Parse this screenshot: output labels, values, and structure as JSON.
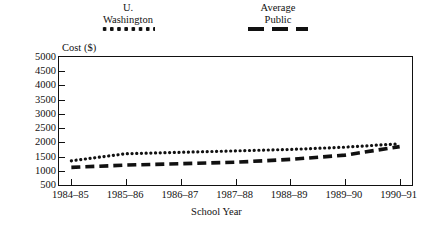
{
  "chart_data": {
    "type": "line",
    "title": "",
    "xlabel": "School Year",
    "ylabel": "Cost ($)",
    "categories": [
      "1984–85",
      "1985–86",
      "1986–87",
      "1987–88",
      "1988–89",
      "1989–90",
      "1990–91"
    ],
    "ylim": [
      500,
      5000
    ],
    "yticks": [
      500,
      1000,
      1500,
      2000,
      2500,
      3000,
      3500,
      4000,
      4500,
      5000
    ],
    "ytick_labels": [
      "500",
      "1000",
      "1500",
      "2000",
      "2500",
      "3000",
      "3500",
      "4000",
      "4500",
      "5000"
    ],
    "grid": false,
    "legend_position": "top",
    "series": [
      {
        "name": "U. Washington",
        "name_lines": "U.\nWashington",
        "style": "dotted",
        "color": "#111111",
        "values": [
          1350,
          1600,
          1650,
          1700,
          1750,
          1830,
          1950
        ]
      },
      {
        "name": "Average Public",
        "name_lines": "Average\nPublic",
        "style": "dashed",
        "color": "#111111",
        "values": [
          1120,
          1200,
          1250,
          1300,
          1400,
          1550,
          1850
        ]
      }
    ]
  },
  "legend": {
    "items": [
      {
        "label": "U.\nWashington",
        "marker": "dotted-line-swatch"
      },
      {
        "label": "Average\nPublic",
        "marker": "dashed-line-swatch"
      }
    ]
  }
}
